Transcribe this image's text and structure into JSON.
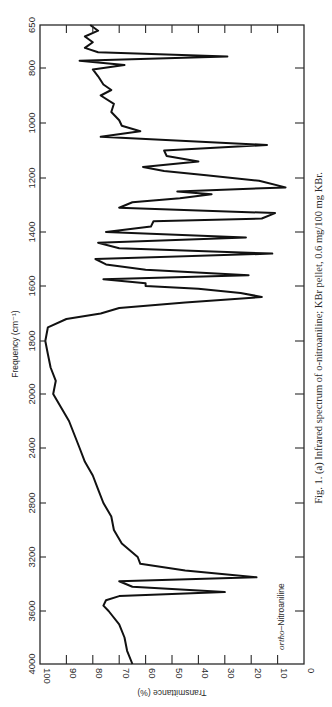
{
  "chart_data": {
    "type": "line",
    "orientation": "rotated-90 (frequency axis vertical, transmittance axis horizontal, reversed)",
    "title": "Fig. 1. (a) Infrared spectrum of o-nitroaniline; KBr pellet, 0.6 mg/100 mg KBr.",
    "caption": "Fig. 1. (a) Infrared spectrum of o-nitroaniline; KBr pellet, 0.6 mg/100 mg KBr.",
    "xlabel": "Frequency (cm⁻¹)",
    "ylabel": "Transmittance (%)",
    "annotation": "ortho–Nitroaniline",
    "annotation_prefix": "ortho",
    "annotation_suffix": "–Nitroaniline",
    "frequency_ticks": [
      "650",
      "800",
      "1000",
      "1200",
      "1400",
      "1600",
      "1800",
      "2000",
      "2400",
      "2800",
      "3200",
      "3600",
      "4000"
    ],
    "transmittance_ticks": [
      "100",
      "90",
      "80",
      "70",
      "60",
      "50",
      "40",
      "30",
      "20",
      "10",
      "0"
    ],
    "xlim": [
      650,
      4000
    ],
    "ylim": [
      0,
      100
    ],
    "grid": false,
    "legend": null,
    "series": [
      {
        "name": "ortho-Nitroaniline",
        "x": [
          650,
          670,
          690,
          710,
          730,
          745,
          760,
          775,
          790,
          805,
          830,
          860,
          880,
          900,
          930,
          960,
          990,
          1010,
          1030,
          1050,
          1080,
          1100,
          1120,
          1140,
          1160,
          1175,
          1190,
          1210,
          1235,
          1250,
          1260,
          1275,
          1290,
          1310,
          1330,
          1350,
          1360,
          1380,
          1400,
          1420,
          1440,
          1460,
          1480,
          1500,
          1520,
          1540,
          1560,
          1575,
          1590,
          1600,
          1610,
          1625,
          1640,
          1660,
          1680,
          1700,
          1720,
          1750,
          1800,
          1850,
          1900,
          1950,
          2000,
          2100,
          2200,
          2300,
          2400,
          2500,
          2600,
          2700,
          2800,
          2900,
          3000,
          3100,
          3200,
          3250,
          3300,
          3350,
          3380,
          3420,
          3460,
          3490,
          3520,
          3560,
          3600,
          3700,
          3800,
          3900,
          4000
        ],
        "y": [
          81,
          78,
          83,
          80,
          83,
          78,
          29,
          85,
          68,
          80,
          78,
          76,
          73,
          77,
          72,
          73,
          70,
          69,
          62,
          77,
          14,
          53,
          52,
          40,
          61,
          53,
          37,
          17,
          7,
          48,
          35,
          47,
          65,
          70,
          11,
          16,
          57,
          58,
          75,
          22,
          78,
          70,
          12,
          79,
          75,
          60,
          21,
          76,
          60,
          60,
          40,
          24,
          16,
          45,
          70,
          77,
          90,
          97,
          98,
          97,
          96,
          94,
          95,
          92,
          89,
          87,
          85,
          83,
          80,
          78,
          76,
          73,
          72,
          69,
          63,
          62,
          45,
          18,
          70,
          65,
          30,
          70,
          75,
          76,
          74,
          70,
          68,
          67,
          65
        ]
      }
    ]
  }
}
